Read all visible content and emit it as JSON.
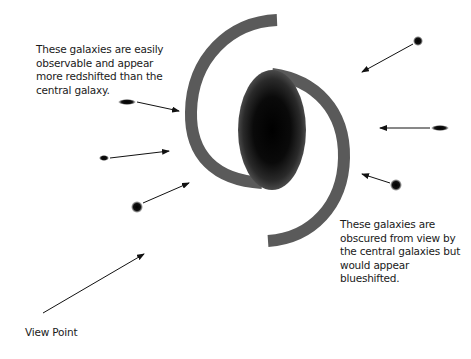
{
  "diagram": {
    "type": "galaxy-redshift-viewpoint-illustration",
    "captions": {
      "redshifted": "These galaxies are easily observable and appear more redshifted than the central galaxy.",
      "blueshifted": "These galaxies are obscured from view by the central galaxies but would appear blueshifted.",
      "view_point": "View Point"
    },
    "colors": {
      "spiral_arm": "#5a5a5a",
      "bulge_core": "#000000",
      "bulge_edge": "#4a4a4a",
      "arrow": "#111111",
      "text": "#1a1a1a",
      "background": "#ffffff"
    },
    "central_galaxy": {
      "label": "central galaxy",
      "center": [
        272,
        130
      ],
      "rx": 34,
      "ry": 60
    },
    "satellite_galaxies": [
      {
        "name": "left-galaxy-1",
        "shape": "elongated",
        "cx": 127,
        "cy": 102,
        "rx": 9,
        "ry": 3
      },
      {
        "name": "left-galaxy-2",
        "shape": "small-oval",
        "cx": 104,
        "cy": 158,
        "rx": 5,
        "ry": 3
      },
      {
        "name": "left-galaxy-3",
        "shape": "round",
        "cx": 137,
        "cy": 207,
        "rx": 6,
        "ry": 6
      },
      {
        "name": "right-galaxy-1",
        "shape": "round",
        "cx": 418,
        "cy": 41,
        "rx": 5,
        "ry": 5
      },
      {
        "name": "right-galaxy-2",
        "shape": "elongated",
        "cx": 440,
        "cy": 128,
        "rx": 9,
        "ry": 3
      },
      {
        "name": "right-galaxy-3",
        "shape": "round",
        "cx": 396,
        "cy": 185,
        "rx": 6,
        "ry": 6
      }
    ],
    "arrows": [
      {
        "name": "arrow-left-1",
        "from": [
          137,
          102
        ],
        "to": [
          179,
          111
        ]
      },
      {
        "name": "arrow-left-2",
        "from": [
          110,
          158
        ],
        "to": [
          169,
          151
        ]
      },
      {
        "name": "arrow-left-3",
        "from": [
          143,
          203
        ],
        "to": [
          189,
          183
        ]
      },
      {
        "name": "arrow-right-1",
        "from": [
          413,
          44
        ],
        "to": [
          362,
          72
        ]
      },
      {
        "name": "arrow-right-2",
        "from": [
          430,
          128
        ],
        "to": [
          380,
          128
        ]
      },
      {
        "name": "arrow-right-3",
        "from": [
          390,
          183
        ],
        "to": [
          362,
          174
        ]
      },
      {
        "name": "arrow-viewpoint",
        "from": [
          43,
          313
        ],
        "to": [
          144,
          254
        ]
      }
    ]
  }
}
